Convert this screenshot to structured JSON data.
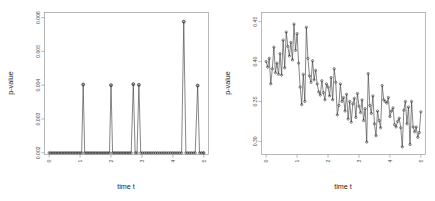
{
  "figure": {
    "panels": [
      "left",
      "right"
    ]
  },
  "chart_data": [
    {
      "panel": "left",
      "type": "line",
      "title": "",
      "xlabel": "time t",
      "ylabel": "p-value",
      "xlim": [
        -0.15,
        5.15
      ],
      "ylim": [
        0.00195,
        0.00615
      ],
      "xticks": [
        0,
        1,
        2,
        3,
        4,
        5
      ],
      "xticklabels": [
        "0",
        "1",
        "2",
        "3",
        "4",
        "5"
      ],
      "yticks": [
        0.002,
        0.003,
        0.004,
        0.005,
        0.006
      ],
      "yticklabels": [
        "0.002",
        "0.003",
        "0.004",
        "0.005",
        "0.006"
      ],
      "grid": false,
      "legend": null,
      "marker": "open-circle",
      "baseline": 0.002,
      "spikes": [
        {
          "x": 1.1,
          "y": 0.00402
        },
        {
          "x": 2.0,
          "y": 0.004
        },
        {
          "x": 2.72,
          "y": 0.00403
        },
        {
          "x": 2.9,
          "y": 0.00401
        },
        {
          "x": 4.35,
          "y": 0.00588
        },
        {
          "x": 4.8,
          "y": 0.00399
        }
      ],
      "x": [
        0.0,
        0.05,
        0.1,
        0.15,
        0.2,
        0.25,
        0.3,
        0.35,
        0.4,
        0.45,
        0.5,
        0.55,
        0.6,
        0.65,
        0.7,
        0.75,
        0.8,
        0.85,
        0.9,
        0.95,
        1.0,
        1.05,
        1.1,
        1.15,
        1.2,
        1.25,
        1.3,
        1.35,
        1.4,
        1.45,
        1.5,
        1.55,
        1.6,
        1.65,
        1.7,
        1.75,
        1.8,
        1.85,
        1.9,
        1.95,
        2.0,
        2.05,
        2.1,
        2.15,
        2.2,
        2.25,
        2.3,
        2.35,
        2.4,
        2.45,
        2.5,
        2.55,
        2.6,
        2.65,
        2.72,
        2.78,
        2.84,
        2.9,
        2.96,
        3.02,
        3.08,
        3.14,
        3.2,
        3.26,
        3.32,
        3.38,
        3.44,
        3.5,
        3.56,
        3.62,
        3.68,
        3.74,
        3.8,
        3.86,
        3.92,
        3.98,
        4.04,
        4.1,
        4.16,
        4.22,
        4.28,
        4.35,
        4.42,
        4.48,
        4.54,
        4.6,
        4.66,
        4.72,
        4.8,
        4.86,
        4.92,
        4.98,
        5.0
      ],
      "y": [
        0.002,
        0.002,
        0.002,
        0.002,
        0.002,
        0.002,
        0.002,
        0.002,
        0.002,
        0.002,
        0.002,
        0.002,
        0.002,
        0.002,
        0.002,
        0.002,
        0.002,
        0.002,
        0.002,
        0.002,
        0.002,
        0.002,
        0.00402,
        0.002,
        0.002,
        0.002,
        0.002,
        0.002,
        0.002,
        0.002,
        0.002,
        0.002,
        0.002,
        0.002,
        0.002,
        0.002,
        0.002,
        0.002,
        0.002,
        0.002,
        0.004,
        0.002,
        0.002,
        0.002,
        0.002,
        0.002,
        0.002,
        0.002,
        0.002,
        0.002,
        0.002,
        0.002,
        0.002,
        0.002,
        0.00403,
        0.002,
        0.002,
        0.00401,
        0.002,
        0.002,
        0.002,
        0.002,
        0.002,
        0.002,
        0.002,
        0.002,
        0.002,
        0.002,
        0.002,
        0.002,
        0.002,
        0.002,
        0.002,
        0.002,
        0.002,
        0.002,
        0.002,
        0.002,
        0.002,
        0.002,
        0.002,
        0.00588,
        0.002,
        0.002,
        0.002,
        0.002,
        0.002,
        0.002,
        0.00399,
        0.002,
        0.002,
        0.002,
        0.002
      ]
    },
    {
      "panel": "right",
      "type": "line",
      "title": "",
      "xlabel": "time t",
      "ylabel": "p-value",
      "xlim": [
        -0.15,
        5.15
      ],
      "ylim": [
        0.2835,
        0.4615
      ],
      "xticks": [
        0,
        1,
        2,
        3,
        4,
        5
      ],
      "xticklabels": [
        "0",
        "1",
        "2",
        "3",
        "4",
        "5"
      ],
      "yticks": [
        0.3,
        0.35,
        0.4,
        0.45
      ],
      "yticklabels": [
        "0.30",
        "0.35",
        "0.40",
        "0.45"
      ],
      "grid": false,
      "legend": null,
      "marker": "open-circle",
      "x": [
        0.0,
        0.05,
        0.1,
        0.15,
        0.2,
        0.25,
        0.3,
        0.35,
        0.4,
        0.45,
        0.5,
        0.55,
        0.6,
        0.65,
        0.7,
        0.75,
        0.8,
        0.85,
        0.9,
        0.95,
        1.0,
        1.05,
        1.1,
        1.15,
        1.2,
        1.25,
        1.3,
        1.35,
        1.4,
        1.45,
        1.5,
        1.55,
        1.6,
        1.65,
        1.7,
        1.75,
        1.8,
        1.85,
        1.9,
        1.95,
        2.0,
        2.05,
        2.1,
        2.15,
        2.2,
        2.25,
        2.3,
        2.35,
        2.4,
        2.45,
        2.5,
        2.55,
        2.6,
        2.65,
        2.7,
        2.75,
        2.8,
        2.85,
        2.9,
        2.95,
        3.0,
        3.05,
        3.1,
        3.15,
        3.2,
        3.25,
        3.3,
        3.35,
        3.4,
        3.45,
        3.5,
        3.55,
        3.6,
        3.65,
        3.7,
        3.75,
        3.8,
        3.85,
        3.9,
        3.95,
        4.0,
        4.05,
        4.1,
        4.15,
        4.2,
        4.25,
        4.3,
        4.35,
        4.4,
        4.45,
        4.5,
        4.55,
        4.6,
        4.65,
        4.7,
        4.75,
        4.8,
        4.85,
        4.9,
        4.95,
        5.0
      ],
      "y": [
        0.4,
        0.393,
        0.404,
        0.372,
        0.391,
        0.418,
        0.386,
        0.398,
        0.384,
        0.41,
        0.383,
        0.427,
        0.392,
        0.437,
        0.419,
        0.407,
        0.424,
        0.402,
        0.447,
        0.414,
        0.435,
        0.398,
        0.368,
        0.346,
        0.384,
        0.35,
        0.443,
        0.404,
        0.382,
        0.374,
        0.401,
        0.377,
        0.389,
        0.372,
        0.362,
        0.358,
        0.376,
        0.361,
        0.352,
        0.372,
        0.368,
        0.357,
        0.38,
        0.352,
        0.391,
        0.374,
        0.333,
        0.345,
        0.372,
        0.35,
        0.355,
        0.338,
        0.359,
        0.328,
        0.35,
        0.324,
        0.347,
        0.354,
        0.33,
        0.36,
        0.344,
        0.336,
        0.352,
        0.326,
        0.341,
        0.299,
        0.385,
        0.345,
        0.335,
        0.357,
        0.322,
        0.307,
        0.338,
        0.326,
        0.317,
        0.37,
        0.352,
        0.35,
        0.348,
        0.355,
        0.331,
        0.338,
        0.342,
        0.321,
        0.318,
        0.325,
        0.329,
        0.317,
        0.293,
        0.339,
        0.35,
        0.322,
        0.343,
        0.296,
        0.35,
        0.318,
        0.312,
        0.318,
        0.305,
        0.311,
        0.337
      ]
    }
  ]
}
